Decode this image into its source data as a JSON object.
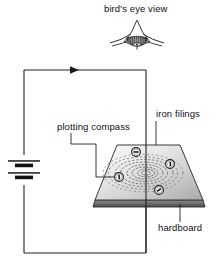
{
  "figure": {
    "title_caption": "bird's eye view",
    "type": "physics-circuit-diagram",
    "labels": {
      "birds_eye_view": "bird's eye view",
      "iron_filings": "iron filings",
      "plotting_compass": "plotting compass",
      "hardboard": "hardboard"
    },
    "icons": {
      "bird": "bird-icon",
      "battery": "battery-icon",
      "current_arrow": "current-direction-arrow-icon",
      "compass": "plotting-compass-icon"
    },
    "colors": {
      "line": "#222222",
      "board_light": "#f2f2f2",
      "board_dark": "#9a9a9a",
      "board_edge": "#555555",
      "filings": "#6e6e6e",
      "bird_body": "#3a3a3a",
      "background": "#ffffff"
    },
    "circuit": {
      "components": [
        "battery",
        "connecting wire",
        "vertical wire through hardboard"
      ],
      "current_direction": "clockwise",
      "arrow_position_label": "top wire"
    },
    "board": {
      "shape": "trapezoid",
      "material": "hardboard",
      "pattern": "concentric circles of iron filings",
      "compass_count": 4
    }
  }
}
